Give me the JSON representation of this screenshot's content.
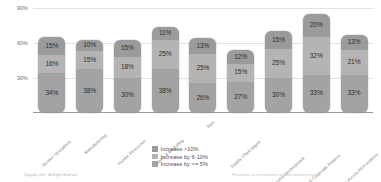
{
  "chart_data": {
    "type": "bar",
    "subtype": "stacked-column",
    "title": "",
    "xlabel": "",
    "ylabel": "",
    "ylim": [
      0,
      90
    ],
    "grid": true,
    "legend_position": "bottom-center",
    "ytick_labels": [
      "30%",
      "60%",
      "90%"
    ],
    "ytick_values": [
      30,
      60,
      90
    ],
    "categories": [
      "Service Operations",
      "Manufacturing",
      "Human Resources",
      "Sales & Marketing",
      "Risk",
      "Supply Chain Mgmt",
      "Product & Service Development",
      "Strategy & Corporate Finance",
      "Average Across All Functions"
    ],
    "series": [
      {
        "name": "Increase >10%",
        "color": "#9b9b9b",
        "values": [
          15,
          10,
          15,
          11,
          13,
          12,
          15,
          20,
          13
        ]
      },
      {
        "name": "Increase by 6-10%",
        "color": "#b4b4b4",
        "values": [
          16,
          15,
          18,
          25,
          25,
          15,
          25,
          32,
          21
        ]
      },
      {
        "name": "Increase by <= 5%",
        "color": "#a3a3a3",
        "values": [
          34,
          38,
          30,
          38,
          26,
          27,
          30,
          33,
          33
        ]
      }
    ],
    "bar_labels": [
      [
        "15%",
        "16%",
        "34%"
      ],
      [
        "10%",
        "15%",
        "38%"
      ],
      [
        "15%",
        "18%",
        "30%"
      ],
      [
        "11%",
        "25%",
        "38%"
      ],
      [
        "13%",
        "25%",
        "26%"
      ],
      [
        "12%",
        "15%",
        "27%"
      ],
      [
        "15%",
        "25%",
        "30%"
      ],
      [
        "20%",
        "32%",
        "33%"
      ],
      [
        "13%",
        "21%",
        "33%"
      ]
    ]
  },
  "legend": {
    "items": [
      {
        "label": "Increase >10%"
      },
      {
        "label": "Increase by 6-10%"
      },
      {
        "label": "Increase by <= 5%"
      }
    ]
  },
  "footer": {
    "left": "Copyright 2021 · All Rights Reserved",
    "right": "Percentages are of respondents reporting revenue increase"
  }
}
